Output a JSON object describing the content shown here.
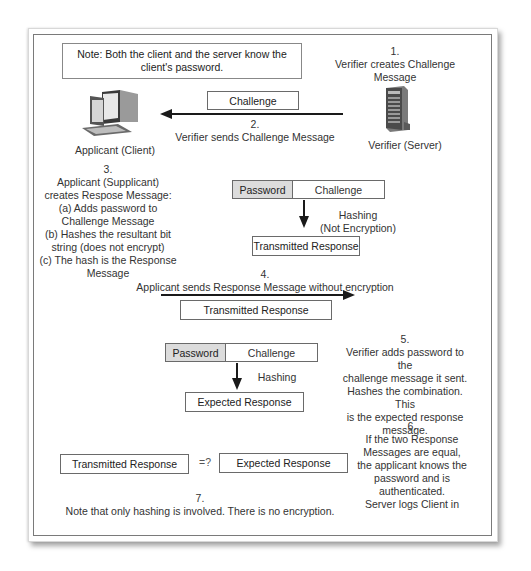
{
  "note": {
    "line1": "Note: Both the client and the server know the",
    "line2": "client's password."
  },
  "step1": {
    "number": "1.",
    "line1": "Verifier creates Challenge",
    "line2": "Message"
  },
  "client": {
    "icon": "desktop-computer-icon",
    "label": "Applicant (Client)"
  },
  "server": {
    "icon": "server-tower-icon",
    "label": "Verifier (Server)"
  },
  "step2": {
    "message_box": "Challenge",
    "number": "2.",
    "text": "Verifier sends Challenge Message",
    "arrow_direction": "left"
  },
  "step3": {
    "number": "3.",
    "lines": [
      "Applicant (Supplicant)",
      "creates Respose Message:",
      "(a) Adds password to",
      "Challenge Message",
      "(b) Hashes the resultant bit",
      "string (does not encrypt)",
      "(c) The hash is the Response",
      "Message"
    ],
    "combined_password": "Password",
    "combined_challenge": "Challenge",
    "hash_label_1": "Hashing",
    "hash_label_2": "(Not Encryption)",
    "result": "Transmitted Response"
  },
  "step4": {
    "number": "4.",
    "text": "Applicant sends Response Message without encryption",
    "message_box": "Transmitted Response",
    "arrow_direction": "right"
  },
  "step5": {
    "combined_password": "Password",
    "combined_challenge": "Challenge",
    "hash_label": "Hashing",
    "result": "Expected Response",
    "number": "5.",
    "lines": [
      "Verifier adds password to the",
      "challenge message it sent.",
      "Hashes the combination. This",
      "is the expected response",
      "message."
    ]
  },
  "step6": {
    "left_box": "Transmitted Response",
    "operator": "=?",
    "right_box": "Expected Response",
    "number": "6.",
    "lines": [
      "If the two Response",
      "Messages are equal,",
      "the applicant knows the",
      "password and is",
      "authenticated.",
      "Server logs Client in"
    ]
  },
  "step7": {
    "number": "7.",
    "text": "Note that only hashing is involved. There is no encryption."
  }
}
